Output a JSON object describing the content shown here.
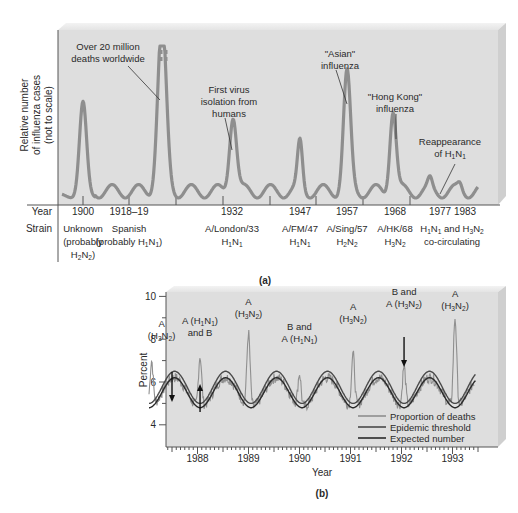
{
  "chart_data": [
    {
      "panel": "a",
      "type": "line",
      "panel_label": "(a)",
      "ylabel_lines": [
        "Relative number",
        "of influenza cases",
        "(not to scale)"
      ],
      "row_labels": {
        "year": "Year",
        "strain": "Strain"
      },
      "line_color": "#8e8e8e",
      "panel_bg": "#dcdcdc",
      "epidemics": [
        {
          "year": "1900",
          "strain_lines": [
            "Unknown",
            "(probably",
            "H2N2)"
          ],
          "relative_peak": 0.62
        },
        {
          "year": "1918–19",
          "strain_lines": [
            "Spanish",
            "(probably H1N1)"
          ],
          "relative_peak": 1.0,
          "off_scale": true
        },
        {
          "year": "1932",
          "strain_lines": [
            "A/London/33",
            "H1N1"
          ],
          "relative_peak": 0.52
        },
        {
          "year": "1947",
          "strain_lines": [
            "A/FM/47",
            "H1N1"
          ],
          "relative_peak": 0.32
        },
        {
          "year": "1957",
          "strain_lines": [
            "A/Sing/57",
            "H2N2"
          ],
          "relative_peak": 0.78
        },
        {
          "year": "1968",
          "strain_lines": [
            "A/HK/68",
            "H3N2"
          ],
          "relative_peak": 0.55
        },
        {
          "year": "1977",
          "strain_lines": [
            "H1N1 and H3N2",
            "co-circulating"
          ],
          "relative_peak": 0.06
        },
        {
          "year": "1983",
          "strain_lines": [],
          "relative_peak": 0.04
        }
      ],
      "annotations": [
        {
          "lines": [
            "Over 20 million",
            "deaths worldwide"
          ],
          "target": "1918–19"
        },
        {
          "lines": [
            "First virus",
            "isolation from",
            "humans"
          ],
          "target": "1932"
        },
        {
          "lines": [
            "\"Asian\"",
            "influenza"
          ],
          "target": "1957"
        },
        {
          "lines": [
            "\"Hong Kong\"",
            "influenza"
          ],
          "target": "1968"
        },
        {
          "lines": [
            "Reappearance",
            "of H1N1"
          ],
          "target": "1977"
        }
      ]
    },
    {
      "panel": "b",
      "type": "line",
      "panel_label": "(b)",
      "xlabel": "Year",
      "ylabel": "Percent",
      "ylim": [
        3.5,
        10
      ],
      "yticks": [
        4,
        6,
        8,
        10
      ],
      "yminor": [
        5,
        7,
        9
      ],
      "xticks": [
        "1988",
        "1989",
        "1990",
        "1991",
        "1992",
        "1993"
      ],
      "xlim": [
        1987.5,
        1993.95
      ],
      "panel_bg": "#dcdcdc",
      "legend": [
        {
          "name": "Proportion of deaths",
          "color": "#8f8f8f"
        },
        {
          "name": "Epidemic threshold",
          "color": "#4a4a4a"
        },
        {
          "name": "Expected number",
          "color": "#2a2a2a"
        }
      ],
      "series": [
        {
          "name": "Epidemic threshold",
          "model": "sinusoid",
          "mean": 5.75,
          "amplitude": 0.75,
          "peak_at": "January each year"
        },
        {
          "name": "Expected number",
          "model": "sinusoid",
          "mean": 5.5,
          "amplitude": 0.7,
          "peak_at": "January each year"
        },
        {
          "name": "Proportion of deaths",
          "peaks": [
            {
              "x": 1987.6,
              "y": 7.0
            },
            {
              "x": 1988.55,
              "y": 7.2
            },
            {
              "x": 1989.5,
              "y": 8.3
            },
            {
              "x": 1990.5,
              "y": 6.4
            },
            {
              "x": 1991.55,
              "y": 7.3
            },
            {
              "x": 1992.55,
              "y": 6.7
            },
            {
              "x": 1993.55,
              "y": 9.0
            }
          ]
        }
      ],
      "annotations": [
        {
          "lines": [
            "A",
            "(H3N2)"
          ],
          "x": 1987.6
        },
        {
          "lines": [
            "A (H1N1)",
            "and B"
          ],
          "x": 1988.55
        },
        {
          "lines": [
            "A",
            "(H3N2)"
          ],
          "x": 1989.5
        },
        {
          "lines": [
            "B and",
            "A (H1N1)"
          ],
          "x": 1990.5
        },
        {
          "lines": [
            "A",
            "(H3N2)"
          ],
          "x": 1991.55
        },
        {
          "lines": [
            "B and",
            "A (H3N2)"
          ],
          "x": 1992.55
        },
        {
          "lines": [
            "A",
            "(H3N2)"
          ],
          "x": 1993.55
        }
      ],
      "arrows": [
        {
          "x": 1988.0,
          "direction": "down"
        },
        {
          "x": 1988.55,
          "direction": "up"
        },
        {
          "x": 1992.55,
          "direction": "down"
        }
      ]
    }
  ]
}
